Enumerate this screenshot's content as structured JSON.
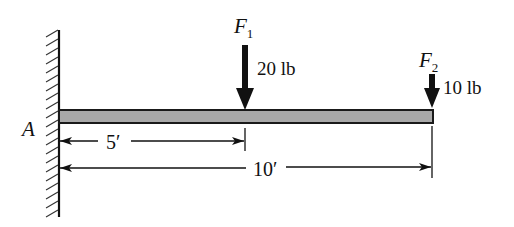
{
  "diagram": {
    "type": "cantilever-beam-free-body",
    "support": {
      "label": "A",
      "type": "fixed-wall"
    },
    "beam": {
      "length_label": "10′",
      "fill_color": "#a9a9a9",
      "stroke_color": "#1a1a1a"
    },
    "forces": [
      {
        "name": "F",
        "subscript": "1",
        "magnitude": "20 lb",
        "direction": "down",
        "position_label": "5′"
      },
      {
        "name": "F",
        "subscript": "2",
        "magnitude": "10 lb",
        "direction": "down",
        "position_label": "10′"
      }
    ],
    "dimensions": [
      {
        "label": "5′",
        "from": "A",
        "to": "F1"
      },
      {
        "label": "10′",
        "from": "A",
        "to": "F2"
      }
    ],
    "colors": {
      "line": "#111111",
      "beam_fill": "#a9a9a9",
      "background": "#ffffff"
    }
  }
}
